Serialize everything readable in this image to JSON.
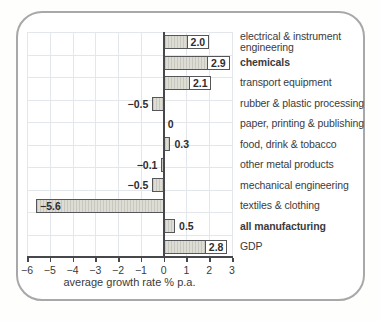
{
  "chart_data": {
    "type": "bar",
    "orientation": "horizontal",
    "categories": [
      "electrical & instrument engineering",
      "chemicals",
      "transport equipment",
      "rubber & plastic processing",
      "paper, printing & publishing",
      "food, drink & tobacco",
      "other metal products",
      "mechanical engineering",
      "textiles & clothing",
      "all manufacturing",
      "GDP"
    ],
    "values": [
      2.0,
      2.9,
      2.1,
      -0.5,
      0,
      0.3,
      -0.1,
      -0.5,
      -5.6,
      0.5,
      2.8
    ],
    "value_labels": [
      "2.0",
      "2.9",
      "2.1",
      "−0.5",
      "0",
      "0.3",
      "−0.1",
      "−0.5",
      "−5.6",
      "0.5",
      "2.8"
    ],
    "label_styles": [
      "box-end",
      "box-end",
      "box-end",
      "outside",
      "outside",
      "outside",
      "outside",
      "outside",
      "inside-start",
      "outside",
      "box-end"
    ],
    "bold_categories": [
      false,
      true,
      false,
      false,
      false,
      false,
      false,
      false,
      false,
      true,
      false
    ],
    "xlabel": "average growth rate % p.a.",
    "xlim": [
      -6,
      3
    ],
    "xticks": [
      -6,
      -5,
      -4,
      -3,
      -2,
      -1,
      0,
      1,
      2,
      3
    ],
    "xtick_labels": [
      "−6",
      "−5",
      "−4",
      "−3",
      "−2",
      "−1",
      "0",
      "1",
      "2",
      "3"
    ],
    "grid": true,
    "legend": "none",
    "colors": {
      "bar_fill": "#dddcd5",
      "bar_border": "#55565a",
      "grid_line": "#e3e7eb",
      "axis_line": "#47484b",
      "text": "#3a3a3c",
      "card_border": "#a8a8a8",
      "value_box_bg": "#ffffff"
    }
  }
}
